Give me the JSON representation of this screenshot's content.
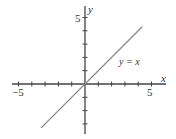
{
  "chart_data": {
    "type": "line",
    "title": "",
    "xlabel": "x",
    "ylabel": "y",
    "xlim": [
      -5.5,
      6
    ],
    "ylim": [
      -3.8,
      5.8
    ],
    "x_tick_labels": [
      "-5",
      "5"
    ],
    "y_tick_labels": [
      "5"
    ],
    "x_ticks": [
      -5,
      -4,
      -3,
      -2,
      -1,
      1,
      2,
      3,
      4,
      5
    ],
    "y_ticks": [
      -3,
      -2,
      -1,
      1,
      2,
      3,
      4,
      5
    ],
    "grid": false,
    "series": [
      {
        "name": "y = x",
        "x": [
          -3.3,
          4.3
        ],
        "y": [
          -3.3,
          4.3
        ],
        "color": "#888888"
      }
    ],
    "annotations": [
      {
        "text": "y = x",
        "x": 2.6,
        "y": 1.7
      }
    ]
  },
  "labels": {
    "x_axis": "x",
    "y_axis": "y",
    "x_neg5": "−5",
    "x_pos5": "5",
    "y_pos5": "5",
    "curve": "y = x"
  },
  "colors": {
    "axis": "#444444",
    "line": "#888888"
  }
}
